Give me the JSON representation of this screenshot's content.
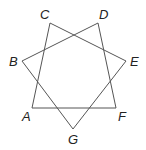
{
  "diagram": {
    "type": "heptagram",
    "stroke_color": "#555555",
    "vertices": [
      {
        "id": "A",
        "label": "A",
        "x": 32,
        "y": 108,
        "lx": 22,
        "ly": 121
      },
      {
        "id": "B",
        "label": "B",
        "x": 22,
        "y": 61,
        "lx": 9,
        "ly": 66
      },
      {
        "id": "C",
        "label": "C",
        "x": 50,
        "y": 23,
        "lx": 40,
        "ly": 19
      },
      {
        "id": "D",
        "label": "D",
        "x": 98,
        "y": 23,
        "lx": 99,
        "ly": 19
      },
      {
        "id": "E",
        "label": "E",
        "x": 126,
        "y": 61,
        "lx": 130,
        "ly": 66
      },
      {
        "id": "F",
        "label": "F",
        "x": 116,
        "y": 108,
        "lx": 118,
        "ly": 121
      },
      {
        "id": "G",
        "label": "G",
        "x": 73,
        "y": 129,
        "lx": 68,
        "ly": 144
      }
    ],
    "edges": [
      [
        "A",
        "C"
      ],
      [
        "C",
        "E"
      ],
      [
        "E",
        "G"
      ],
      [
        "G",
        "B"
      ],
      [
        "B",
        "D"
      ],
      [
        "D",
        "F"
      ],
      [
        "F",
        "A"
      ]
    ]
  }
}
